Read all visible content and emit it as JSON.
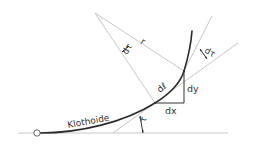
{
  "diagram": {
    "colors": {
      "line": "#b9b9b9",
      "curve": "#2a2a2a",
      "text": "#333333",
      "background": "#ffffff"
    },
    "labels": {
      "curve_name": "Klothoide",
      "radius": "r",
      "d_tau_center": "dτ",
      "d_tau_tangent": "dτ",
      "arc_element": "dℓ",
      "dx": "dx",
      "dy": "dy",
      "tau": "τ"
    },
    "elements": [
      "baseline",
      "start-point-circle",
      "clothoid-curve",
      "tangent-line-at-P",
      "tangent-line-at-Q",
      "radius-line-to-P",
      "radius-line-to-Q",
      "differential-triangle"
    ]
  }
}
